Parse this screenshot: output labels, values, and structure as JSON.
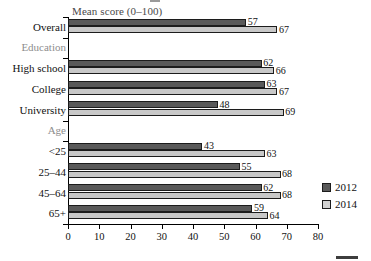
{
  "chart_data": {
    "type": "bar",
    "orientation": "horizontal",
    "title": "Mean score (0–100)",
    "xlabel": "",
    "ylabel": "",
    "xlim": [
      0,
      80
    ],
    "xticks": [
      0,
      10,
      20,
      30,
      40,
      50,
      60,
      70,
      80
    ],
    "xtick_labels": [
      "0",
      "10",
      "20",
      "30",
      "40",
      "50",
      "60",
      "70",
      "80"
    ],
    "grid": false,
    "legend_position": "right",
    "categories": [
      "Overall",
      "Education",
      "High school",
      "College",
      "University",
      "Age",
      "<25",
      "25–44",
      "45–64",
      "65+"
    ],
    "group_headers": [
      "Education",
      "Age"
    ],
    "series": [
      {
        "name": "2012",
        "color": "#595959",
        "values": [
          57,
          null,
          62,
          63,
          48,
          null,
          43,
          55,
          62,
          59
        ]
      },
      {
        "name": "2014",
        "color": "#c8c8c8",
        "values": [
          67,
          null,
          66,
          67,
          69,
          null,
          63,
          68,
          68,
          64
        ]
      }
    ]
  },
  "legend": {
    "items": [
      {
        "label": "2012",
        "swatch": "dark-gray-swatch"
      },
      {
        "label": "2014",
        "swatch": "light-gray-swatch"
      }
    ]
  },
  "rows": [
    {
      "label": "Overall",
      "group": false,
      "v2012": 57,
      "v2014": 67
    },
    {
      "label": "Education",
      "group": true,
      "v2012": null,
      "v2014": null
    },
    {
      "label": "High school",
      "group": false,
      "v2012": 62,
      "v2014": 66
    },
    {
      "label": "College",
      "group": false,
      "v2012": 63,
      "v2014": 67
    },
    {
      "label": "University",
      "group": false,
      "v2012": 48,
      "v2014": 69
    },
    {
      "label": "Age",
      "group": true,
      "v2012": null,
      "v2014": null
    },
    {
      "label": "<25",
      "group": false,
      "v2012": 43,
      "v2014": 63
    },
    {
      "label": "25–44",
      "group": false,
      "v2012": 55,
      "v2014": 68
    },
    {
      "label": "45–64",
      "group": false,
      "v2012": 62,
      "v2014": 68
    },
    {
      "label": "65+",
      "group": false,
      "v2012": 59,
      "v2014": 64
    }
  ],
  "colors": {
    "series_2012": "#595959",
    "series_2014": "#c8c8c8",
    "axis": "#000000",
    "title_text": "#4a4a4a",
    "group_label_text": "#8d8d8d",
    "background": "#ffffff"
  }
}
